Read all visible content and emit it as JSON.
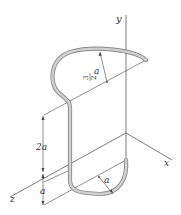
{
  "figure": {
    "axes": {
      "x_label": "x",
      "y_label": "y",
      "z_label": "z"
    },
    "dimensions": {
      "upper_radius_label_num": "3",
      "upper_radius_label_den": "2",
      "upper_radius_label_var": "a",
      "lower_radius_label": "a",
      "vertical_span_label": "2a",
      "bottom_offset_label": "a"
    },
    "colors": {
      "wire_outline": "#8a8a8a",
      "wire_fill": "#d0d0d0",
      "line": "#444444",
      "text": "#333333"
    }
  }
}
